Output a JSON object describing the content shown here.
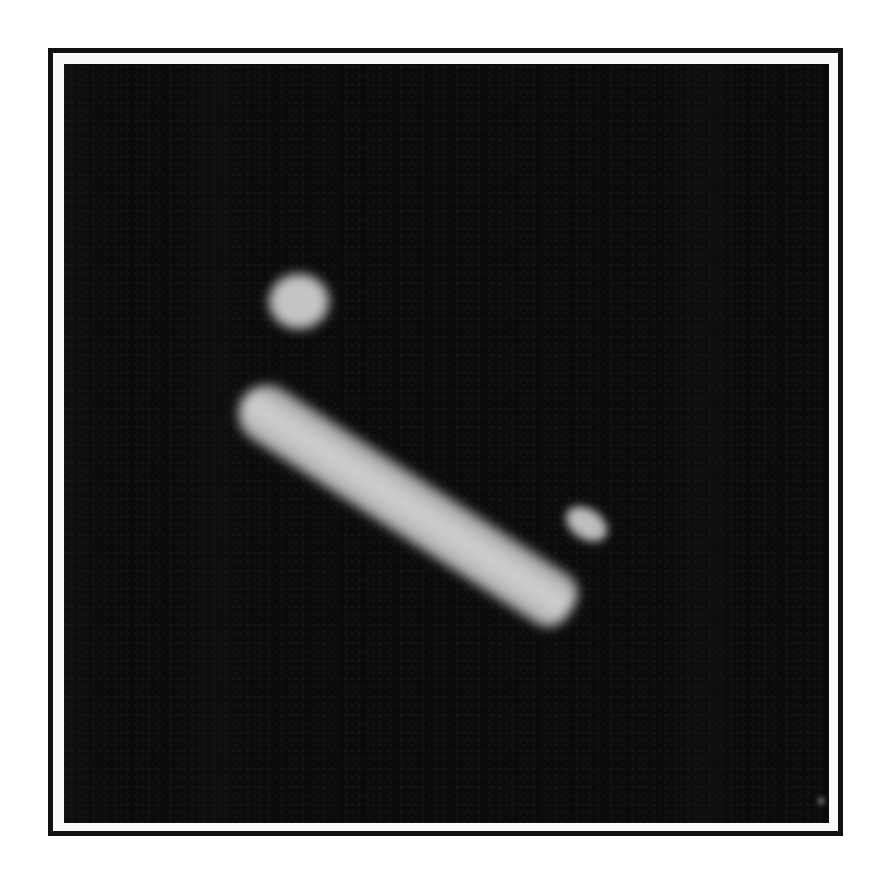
{
  "image": {
    "description": "Microscopy image of a single elongated, bright cell oriented diagonally on a dark background, inside a double-line frame",
    "subject": "elongated cell",
    "background_color": "#0b0b0b",
    "cell_color": "#c8c8c8",
    "frame_color": "#111111",
    "page_background": "#ffffff"
  }
}
